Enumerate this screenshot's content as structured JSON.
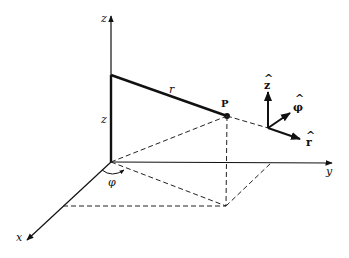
{
  "diagram": {
    "labels": {
      "z_axis": "z",
      "x_axis": "x",
      "y_axis": "y",
      "height": "z",
      "radius": "r",
      "point": "P",
      "angle": "φ",
      "unit_z": "ẑ",
      "unit_phi": "φ̂",
      "unit_r": "r̂"
    },
    "unit_hats": {
      "z": "^",
      "phi": "^",
      "r": "^"
    },
    "unit_bases": {
      "z": "z",
      "phi": "φ",
      "r": "r"
    },
    "colors": {
      "line": "#111111",
      "background": "#ffffff"
    }
  }
}
